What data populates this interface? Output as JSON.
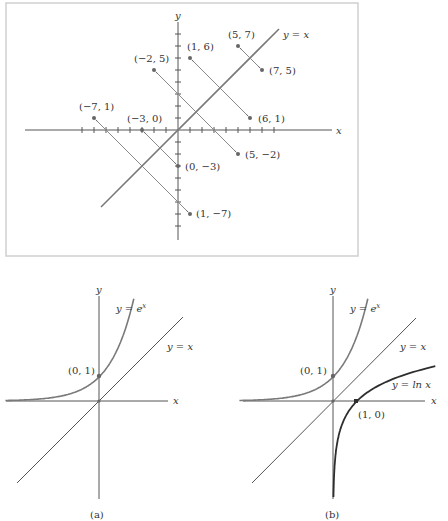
{
  "top_figure": {
    "axis_labels": {
      "x": "x",
      "y": "y"
    },
    "diagonal_label": "y = x",
    "unit_px": 12,
    "origin_px": [
      178,
      130
    ],
    "ticks": {
      "x_min": -8,
      "x_max": 8,
      "y_min": -8,
      "y_max": 8
    },
    "pairs": [
      {
        "from": {
          "x": -7,
          "y": 1,
          "label": "(−7, 1)"
        },
        "to": {
          "x": 1,
          "y": -7,
          "label": "(1, −7)"
        }
      },
      {
        "from": {
          "x": -3,
          "y": 0,
          "label": "(−3, 0)"
        },
        "to": {
          "x": 0,
          "y": -3,
          "label": "(0, −3)"
        }
      },
      {
        "from": {
          "x": -2,
          "y": 5,
          "label": "(−2, 5)"
        },
        "to": {
          "x": 5,
          "y": -2,
          "label": "(5, −2)"
        }
      },
      {
        "from": {
          "x": 1,
          "y": 6,
          "label": "(1, 6)"
        },
        "to": {
          "x": 6,
          "y": 1,
          "label": "(6, 1)"
        }
      },
      {
        "from": {
          "x": 5,
          "y": 7,
          "label": "(5, 7)"
        },
        "to": {
          "x": 7,
          "y": 5,
          "label": "(7, 5)"
        }
      }
    ]
  },
  "graph_a": {
    "caption": "(a)",
    "axis_labels": {
      "x": "x",
      "y": "y"
    },
    "curve_label": "y = e",
    "curve_label_sup": "x",
    "line_label": "y = x",
    "point_label": "(0, 1)"
  },
  "graph_b": {
    "caption": "(b)",
    "axis_labels": {
      "x": "x",
      "y": "y"
    },
    "exp_label": "y = e",
    "exp_label_sup": "x",
    "line_label": "y = x",
    "ln_label": "y = ln x",
    "point_exp_label": "(0, 1)",
    "point_ln_label": "(1, 0)"
  },
  "chart_data": [
    {
      "type": "scatter",
      "title": "Reflection of points across y = x",
      "xlabel": "x",
      "ylabel": "y",
      "xlim": [
        -8,
        8
      ],
      "ylim": [
        -8,
        8
      ],
      "grid": false,
      "series": [
        {
          "name": "original",
          "points": [
            [
              -7,
              1
            ],
            [
              -3,
              0
            ],
            [
              -2,
              5
            ],
            [
              1,
              6
            ],
            [
              5,
              7
            ]
          ]
        },
        {
          "name": "reflected",
          "points": [
            [
              1,
              -7
            ],
            [
              0,
              -3
            ],
            [
              5,
              -2
            ],
            [
              6,
              1
            ],
            [
              7,
              5
            ]
          ]
        },
        {
          "name": "y = x",
          "line": [
            [
              -6.4,
              -6.4
            ],
            [
              8.4,
              8.4
            ]
          ]
        }
      ]
    },
    {
      "type": "line",
      "title": "(a)",
      "xlabel": "x",
      "ylabel": "y",
      "series": [
        {
          "name": "y = e^x",
          "points": [
            [
              -4,
              0.018
            ],
            [
              -2,
              0.135
            ],
            [
              -1,
              0.368
            ],
            [
              0,
              1
            ],
            [
              1,
              2.718
            ],
            [
              1.5,
              4.48
            ]
          ]
        },
        {
          "name": "y = x",
          "points": [
            [
              -3.4,
              -3.4
            ],
            [
              3.5,
              3.5
            ]
          ]
        }
      ],
      "annotations": [
        "(0, 1)"
      ]
    },
    {
      "type": "line",
      "title": "(b)",
      "xlabel": "x",
      "ylabel": "y",
      "series": [
        {
          "name": "y = e^x",
          "points": [
            [
              -4,
              0.018
            ],
            [
              -2,
              0.135
            ],
            [
              -1,
              0.368
            ],
            [
              0,
              1
            ],
            [
              1,
              2.718
            ],
            [
              1.5,
              4.48
            ]
          ]
        },
        {
          "name": "y = x",
          "points": [
            [
              -3.4,
              -3.4
            ],
            [
              3.5,
              3.5
            ]
          ]
        },
        {
          "name": "y = ln x",
          "points": [
            [
              0.018,
              -4
            ],
            [
              0.135,
              -2
            ],
            [
              0.368,
              -1
            ],
            [
              1,
              0
            ],
            [
              2.718,
              1
            ],
            [
              4.48,
              1.5
            ]
          ]
        }
      ],
      "annotations": [
        "(0, 1)",
        "(1, 0)"
      ]
    }
  ]
}
